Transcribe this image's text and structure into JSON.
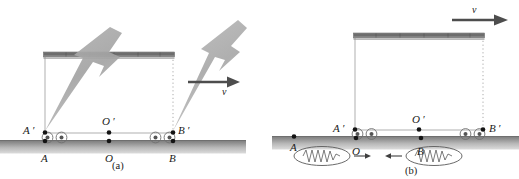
{
  "figure": {
    "caption_a": "(a)",
    "caption_b": "(b)",
    "colors": {
      "ink": "#1a1a1a",
      "ground_dark": "#8a8a8a",
      "ground_light": "#d8d8d8",
      "car_roof": "#6e6e6e",
      "car_outline": "#9a9a9a",
      "bolt": "#9d9d9d",
      "arrow": "#4d4d4d",
      "wave_outline": "#555555"
    }
  },
  "panel_a": {
    "name": "panel-a",
    "points": [
      {
        "id": "A-prime",
        "label": "A ′",
        "x": 37,
        "y": 131
      },
      {
        "id": "O-prime",
        "label": "O ′",
        "x": 106,
        "y": 131
      },
      {
        "id": "B-prime",
        "label": "B ′",
        "x": 172,
        "y": 131
      },
      {
        "id": "A",
        "label": "A",
        "x": 41,
        "y": 145
      },
      {
        "id": "O",
        "label": "O",
        "x": 106,
        "y": 145
      },
      {
        "id": "B",
        "label": "B",
        "x": 172,
        "y": 145
      }
    ],
    "velocity": {
      "symbol": "v",
      "direction": "right"
    },
    "lightning_bolts": 2,
    "wheels": 4
  },
  "panel_b": {
    "name": "panel-b",
    "points": [
      {
        "id": "A-prime",
        "label": "A ′",
        "x": 350,
        "y": 130
      },
      {
        "id": "O-prime",
        "label": "O ′",
        "x": 417,
        "y": 130
      },
      {
        "id": "B-prime",
        "label": "B ′",
        "x": 483,
        "y": 130
      },
      {
        "id": "A",
        "label": "A",
        "x": 293,
        "y": 140
      },
      {
        "id": "O",
        "label": "O",
        "x": 354,
        "y": 141
      },
      {
        "id": "B",
        "label": "B",
        "x": 419,
        "y": 141
      }
    ],
    "velocity": {
      "symbol": "v",
      "direction": "right"
    },
    "wave_packets": 2,
    "wheels": 4
  }
}
